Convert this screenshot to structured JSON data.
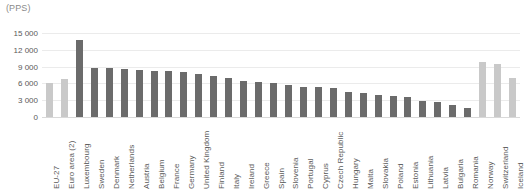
{
  "chart_data": {
    "type": "bar",
    "title": "(PPS)",
    "xlabel": "",
    "ylabel": "",
    "ylim": [
      0,
      15000
    ],
    "yticks": [
      0,
      3000,
      6000,
      9000,
      12000,
      15000
    ],
    "ytick_labels": [
      "0",
      "3 000",
      "6 000",
      "9 000",
      "12 000",
      "15 000"
    ],
    "grid": true,
    "legend": "none",
    "colors": {
      "aggregate_bar": "#c9c9c9",
      "country_bar": "#6b6b6b",
      "gridline": "#ebebeb",
      "axis": "#d9d9d9",
      "tick_text": "#595959",
      "title_text": "#8a8a8a",
      "background": "#ffffff"
    },
    "categories": [
      "EU-27",
      "Euro area (2)",
      "Luxembourg",
      "Sweden",
      "Denmark",
      "Netherlands",
      "Austria",
      "Belgium",
      "France",
      "Germany",
      "United Kingdom",
      "Finland",
      "Italy",
      "Ireland",
      "Greece",
      "Spain",
      "Slovenia",
      "Portugal",
      "Cyprus",
      "Czech Republic",
      "Hungary",
      "Malta",
      "Slovakia",
      "Poland",
      "Estonia",
      "Lithuania",
      "Latvia",
      "Bulgaria",
      "Romania",
      "Norway",
      "Switzerland",
      "Iceland"
    ],
    "values": [
      6100,
      6800,
      13800,
      8700,
      8700,
      8500,
      8400,
      8300,
      8200,
      8000,
      7700,
      7300,
      7000,
      6500,
      6300,
      6100,
      5700,
      5400,
      5300,
      5200,
      4400,
      4300,
      4000,
      3700,
      3600,
      2900,
      2700,
      2200,
      1600,
      9800,
      9400,
      7000
    ],
    "series_style": [
      "aggregate",
      "aggregate",
      "country",
      "country",
      "country",
      "country",
      "country",
      "country",
      "country",
      "country",
      "country",
      "country",
      "country",
      "country",
      "country",
      "country",
      "country",
      "country",
      "country",
      "country",
      "country",
      "country",
      "country",
      "country",
      "country",
      "country",
      "country",
      "country",
      "country",
      "aggregate",
      "aggregate",
      "aggregate"
    ]
  }
}
